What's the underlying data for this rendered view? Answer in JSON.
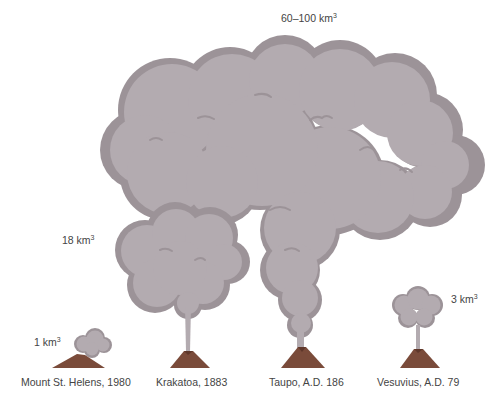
{
  "diagram": {
    "colors": {
      "cloud_fill": "#b3abb0",
      "cloud_outline": "#9c9398",
      "cone_fill": "#7a4b3a",
      "cone_shadow": "#5e372a",
      "label_text": "#444444",
      "background": "#ffffff"
    },
    "volcanoes": [
      {
        "name": "Mount St. Helens, 1980",
        "volume_value": "1 km",
        "volume_exp": "3",
        "volume_km3": 1
      },
      {
        "name": "Krakatoa, 1883",
        "volume_value": "18 km",
        "volume_exp": "3",
        "volume_km3": 18
      },
      {
        "name": "Taupo, A.D. 186",
        "volume_value": "60–100 km",
        "volume_exp": "3",
        "volume_km3_range": [
          60,
          100
        ]
      },
      {
        "name": "Vesuvius, A.D. 79",
        "volume_value": "3 km",
        "volume_exp": "3",
        "volume_km3": 3
      }
    ]
  }
}
